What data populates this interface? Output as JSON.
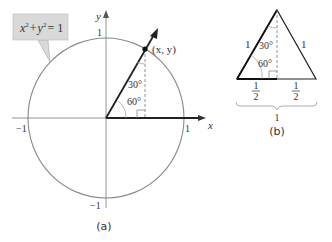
{
  "figure_a": {
    "equation_label": {
      "lhs_x": "x",
      "lhs_y": "y",
      "exp": "2",
      "plus": "+",
      "equals": "= 1"
    },
    "axis_labels": {
      "x": "x",
      "y": "y"
    },
    "ticks": {
      "x_pos": "1",
      "x_neg": "−1",
      "y_pos": "1",
      "y_neg": "−1"
    },
    "point_label": "(x, y)",
    "angle_top": "30°",
    "angle_bottom": "60°",
    "caption": "(a)"
  },
  "figure_b": {
    "side_left": "1",
    "side_right": "1",
    "angle_top": "30°",
    "angle_bottom": "60°",
    "half_left_num": "1",
    "half_left_den": "2",
    "half_right_num": "1",
    "half_right_den": "2",
    "base_total": "1",
    "caption": "(b)"
  },
  "colors": {
    "circle": "#8a8a8a",
    "line": "#2a2a2a",
    "label_box": "#d9d9d9",
    "text": "#333333"
  }
}
